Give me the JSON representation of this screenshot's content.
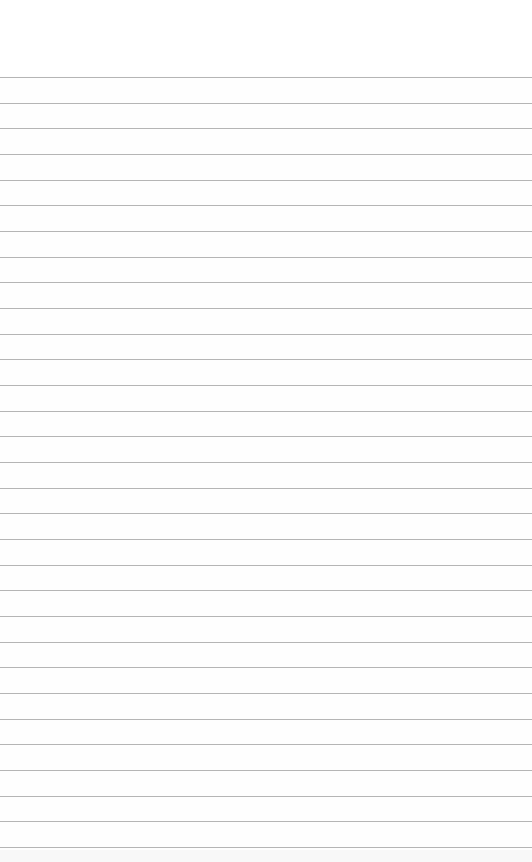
{
  "page": {
    "type": "lined-paper",
    "background_color": "#ffffff",
    "rule_color": "#a8a8a8",
    "first_rule_y": 77,
    "rule_spacing": 25.67,
    "rule_count": 31
  }
}
